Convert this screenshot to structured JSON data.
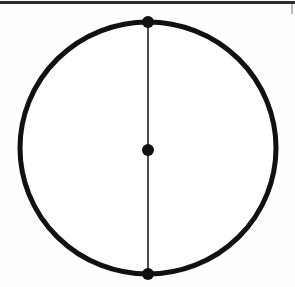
{
  "page": {
    "background_color": "#fefefe",
    "width": 295,
    "height": 287,
    "top_rule": {
      "name": "top-rule",
      "color": "#1a1a1a",
      "thickness": 3,
      "y": 1,
      "x_start": 0,
      "x_end": 295
    },
    "margin_mark": {
      "name": "right-margin-mark",
      "color": "#3a3a3a",
      "x": 291,
      "y": 4
    }
  },
  "figure": {
    "type": "geometry-diagram",
    "stroke_color": "#111111",
    "fill_color": "#ffffff",
    "circle": {
      "name": "circle-outline",
      "center_x": 148,
      "center_y": 148,
      "radius": 128,
      "stroke_width": 5
    },
    "diameter": {
      "name": "vertical-diameter",
      "x1": 148,
      "y1": 20,
      "x2": 148,
      "y2": 276,
      "stroke_width": 2,
      "stroke_color": "#4a4a4a"
    },
    "points": [
      {
        "name": "point-top",
        "label": "",
        "cx": 148,
        "cy": 22,
        "r": 6,
        "color": "#111111"
      },
      {
        "name": "point-center",
        "label": "",
        "cx": 148,
        "cy": 150,
        "r": 6,
        "color": "#111111"
      },
      {
        "name": "point-bottom",
        "label": "",
        "cx": 148,
        "cy": 274,
        "r": 6,
        "color": "#111111"
      }
    ]
  }
}
